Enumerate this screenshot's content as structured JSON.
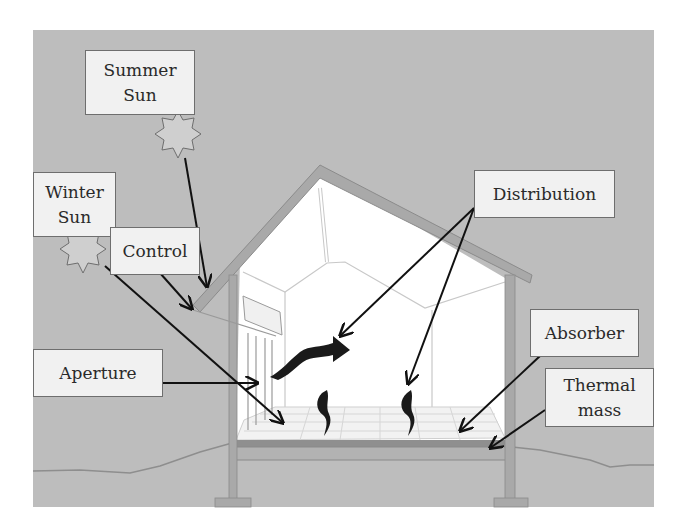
{
  "diagram": {
    "colors": {
      "background": "#bdbdbd",
      "wall": "#a9a9a9",
      "interior": "#ffffff",
      "floor": "#f2f2f2",
      "label_bg": "#f1f1f1",
      "label_border": "#6e6e6e",
      "arrow": "#111111",
      "heat_wave": "#1a1a1a"
    },
    "labels": [
      {
        "id": "summer-sun",
        "text": "Summer\nSun"
      },
      {
        "id": "winter-sun",
        "text": "Winter\nSun"
      },
      {
        "id": "control",
        "text": "Control"
      },
      {
        "id": "distribution",
        "text": "Distribution"
      },
      {
        "id": "aperture",
        "text": "Aperture"
      },
      {
        "id": "absorber",
        "text": "Absorber"
      },
      {
        "id": "thermal-mass",
        "text": "Thermal\nmass"
      }
    ],
    "icons": [
      {
        "id": "summer-sun-icon",
        "shape": "8-point-star"
      },
      {
        "id": "winter-sun-icon",
        "shape": "8-point-star"
      },
      {
        "id": "heat-wave-icon",
        "shape": "wavy-arrow",
        "count": 3
      }
    ]
  }
}
